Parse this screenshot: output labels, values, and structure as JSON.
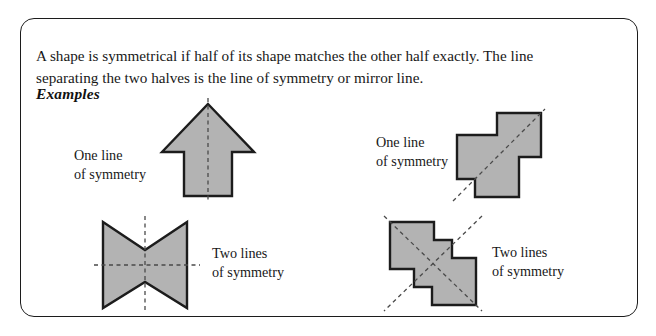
{
  "panel": {
    "intro_text": "A shape is symmetrical if half of its shape matches the other half exactly. The line separating the two halves is the line of symmetry or mirror line.",
    "examples_heading": "Examples",
    "border_color": "#1c1c1c",
    "background_color": "#ffffff"
  },
  "style": {
    "shape_fill": "#b3b3b3",
    "shape_stroke": "#1c1c1c",
    "dash_color": "#4a4a4a",
    "text_color": "#181818"
  },
  "figures": [
    {
      "id": "arrow",
      "name": "up-arrow-shape",
      "caption": "One line\nof symmetry",
      "symmetry_lines": 1,
      "symmetry_axis": "vertical"
    },
    {
      "id": "bowtie",
      "name": "bowtie-shape",
      "caption": "Two lines\nof symmetry",
      "symmetry_lines": 2,
      "symmetry_axis": "vertical and horizontal"
    },
    {
      "id": "cross",
      "name": "cross-polyomino-shape",
      "caption": "One line\nof symmetry",
      "symmetry_lines": 1,
      "symmetry_axis": "diagonal"
    },
    {
      "id": "zshape",
      "name": "z-polyomino-shape",
      "caption": "Two lines\nof symmetry",
      "symmetry_lines": 2,
      "symmetry_axis": "both diagonals"
    }
  ]
}
